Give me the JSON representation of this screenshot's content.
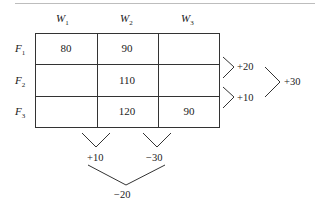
{
  "table": {
    "columns": [
      {
        "base": "W",
        "sub": "1"
      },
      {
        "base": "W",
        "sub": "2"
      },
      {
        "base": "W",
        "sub": "3"
      }
    ],
    "rows": [
      {
        "base": "F",
        "sub": "1",
        "cells": [
          "80",
          "90",
          ""
        ]
      },
      {
        "base": "F",
        "sub": "2",
        "cells": [
          "",
          "110",
          ""
        ]
      },
      {
        "base": "F",
        "sub": "3",
        "cells": [
          "",
          "120",
          "90"
        ]
      }
    ]
  },
  "row_differences": {
    "f1_f2": "+20",
    "f2_f3": "+10",
    "combined": "+30"
  },
  "column_differences": {
    "w1_w2": "+10",
    "w2_w3": "−30",
    "combined": "−20"
  }
}
